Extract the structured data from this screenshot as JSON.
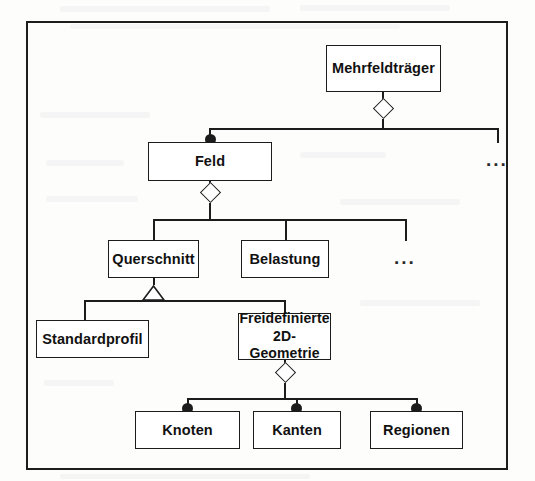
{
  "diagram": {
    "type": "uml-class-composition-hierarchy",
    "language": "de",
    "frame": {
      "visible": true,
      "color": "#1d1d1d"
    },
    "nodes": [
      {
        "id": "mehrfeldtraeger",
        "label": "Mehrfeldträger",
        "x": 326,
        "y": 45,
        "w": 115,
        "h": 47,
        "level": 0
      },
      {
        "id": "feld",
        "label": "Feld",
        "x": 148,
        "y": 142,
        "w": 124,
        "h": 39,
        "level": 1
      },
      {
        "id": "querschnitt",
        "label": "Querschnitt",
        "x": 108,
        "y": 240,
        "w": 91,
        "h": 38,
        "level": 2
      },
      {
        "id": "belastung",
        "label": "Belastung",
        "x": 241,
        "y": 240,
        "w": 88,
        "h": 38,
        "level": 2
      },
      {
        "id": "standardprofil",
        "label": "Standardprofil",
        "x": 36,
        "y": 320,
        "w": 113,
        "h": 38,
        "level": 3
      },
      {
        "id": "freidefinierte-2d-geometrie",
        "label_line1": "Freidefinierte",
        "label_line2": "2D-Geometrie",
        "x": 238,
        "y": 313,
        "w": 93,
        "h": 47,
        "level": 3
      },
      {
        "id": "knoten",
        "label": "Knoten",
        "x": 135,
        "y": 411,
        "w": 105,
        "h": 38,
        "level": 4
      },
      {
        "id": "kanten",
        "label": "Kanten",
        "x": 253,
        "y": 411,
        "w": 88,
        "h": 38,
        "level": 4
      },
      {
        "id": "regionen",
        "label": "Regionen",
        "x": 370,
        "y": 411,
        "w": 93,
        "h": 38,
        "level": 4
      }
    ],
    "ellipses": [
      {
        "id": "ellipsis-feld-siblings",
        "label": "...",
        "x": 486,
        "y": 150
      },
      {
        "id": "ellipsis-querschnitt-siblings",
        "label": "...",
        "x": 394,
        "y": 248
      }
    ],
    "adornments": {
      "diamond_label": "aggregation-diamond",
      "dot_label": "composition-dot",
      "triangle_label": "generalization-triangle"
    },
    "relations": [
      {
        "from": "mehrfeldtraeger",
        "to": "feld",
        "kind": "aggregation",
        "source_marker": "hollow-diamond",
        "target_marker": "filled-dot"
      },
      {
        "from": "mehrfeldtraeger",
        "to": "ellipsis-feld-siblings",
        "kind": "aggregation",
        "source_marker": "hollow-diamond",
        "target_marker": "none"
      },
      {
        "from": "feld",
        "to": "querschnitt",
        "kind": "aggregation",
        "source_marker": "hollow-diamond",
        "target_marker": "none"
      },
      {
        "from": "feld",
        "to": "belastung",
        "kind": "aggregation",
        "source_marker": "hollow-diamond",
        "target_marker": "none"
      },
      {
        "from": "feld",
        "to": "ellipsis-querschnitt-siblings",
        "kind": "aggregation",
        "source_marker": "hollow-diamond",
        "target_marker": "none"
      },
      {
        "from": "querschnitt",
        "to": "standardprofil",
        "kind": "generalization",
        "source_marker": "hollow-triangle",
        "target_marker": "none"
      },
      {
        "from": "querschnitt",
        "to": "freidefinierte-2d-geometrie",
        "kind": "generalization",
        "source_marker": "hollow-triangle",
        "target_marker": "none"
      },
      {
        "from": "freidefinierte-2d-geometrie",
        "to": "knoten",
        "kind": "composition",
        "source_marker": "hollow-diamond",
        "target_marker": "filled-dot"
      },
      {
        "from": "freidefinierte-2d-geometrie",
        "to": "kanten",
        "kind": "composition",
        "source_marker": "hollow-diamond",
        "target_marker": "filled-dot"
      },
      {
        "from": "freidefinierte-2d-geometrie",
        "to": "regionen",
        "kind": "composition",
        "source_marker": "hollow-diamond",
        "target_marker": "filled-dot"
      }
    ],
    "colors": {
      "stroke": "#1c1c1c",
      "frame": "#1d1d1d",
      "node_fill": "#ffffff",
      "text": "#111111",
      "background": "#fdfdfc"
    }
  }
}
